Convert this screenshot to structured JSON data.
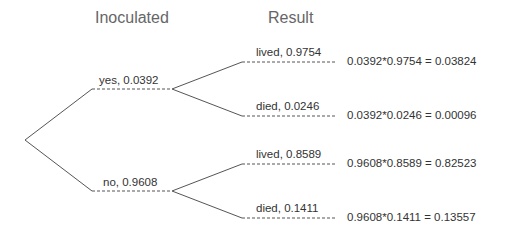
{
  "headers": {
    "inoculated": "Inoculated",
    "result": "Result"
  },
  "branches": {
    "yes": {
      "label": "yes,  0.0392"
    },
    "no": {
      "label": "no,  0.9608"
    }
  },
  "leaves": [
    {
      "label": "lived,  0.9754",
      "result": "0.0392*0.9754  =  0.03824"
    },
    {
      "label": "died,  0.0246",
      "result": "0.0392*0.0246  =  0.00096"
    },
    {
      "label": "lived,  0.8589",
      "result": "0.9608*0.8589  =  0.82523"
    },
    {
      "label": "died,  0.1411",
      "result": "0.9608*0.1411  =  0.13557"
    }
  ],
  "colors": {
    "line": "#555555",
    "text": "#333333",
    "header": "#666666"
  }
}
